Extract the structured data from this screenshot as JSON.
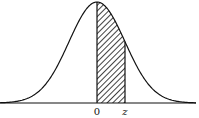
{
  "diagram": {
    "type": "normal-distribution-area",
    "labels": {
      "origin": "0",
      "z": "z"
    },
    "shading": "diagonal-hatch",
    "colors": {
      "stroke": "#111111",
      "background": "#ffffff"
    },
    "geometry": {
      "baseline_y": 103,
      "mean_x": 97,
      "sigma_px": 28,
      "peak_y": 2,
      "z_x": 125,
      "x_start": 0,
      "x_end": 196
    }
  }
}
